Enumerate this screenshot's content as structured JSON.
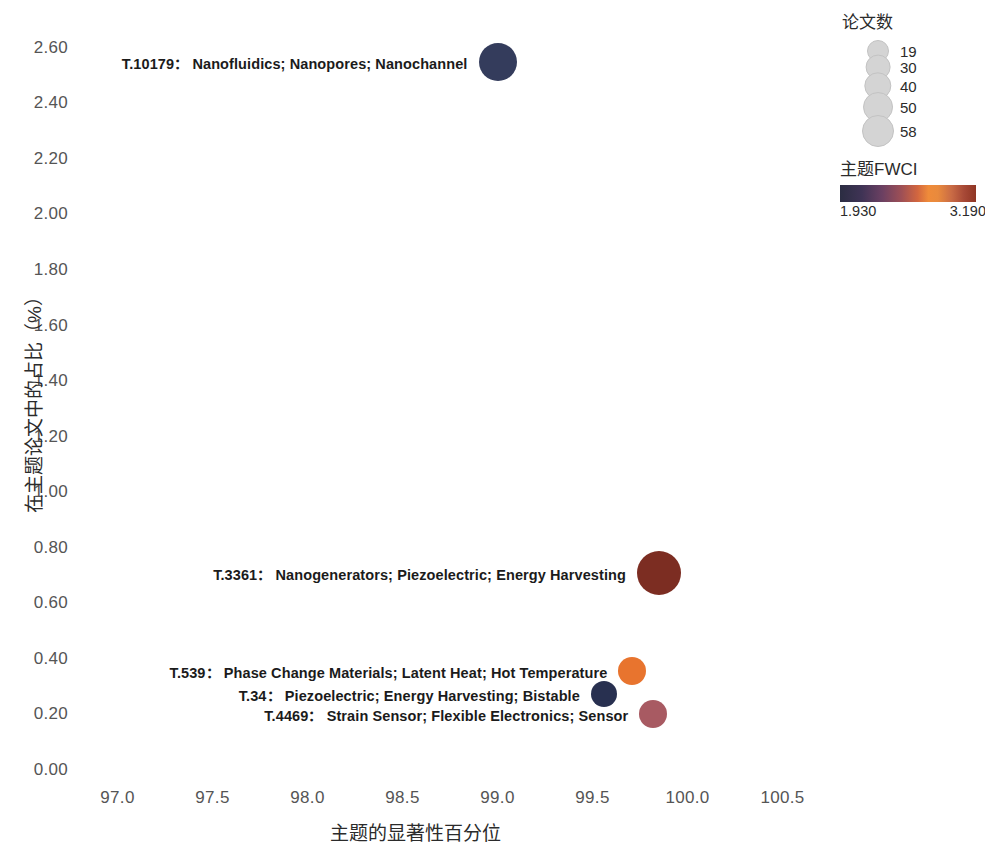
{
  "chart_data": {
    "type": "scatter",
    "title": "",
    "xlabel": "主题的显著性百分位",
    "ylabel": "在主题论文中的占比（%）",
    "xlim": [
      96.75,
      100.75
    ],
    "ylim": [
      0.0,
      2.7
    ],
    "xticks": [
      "97.0",
      "97.5",
      "98.0",
      "98.5",
      "99.0",
      "99.5",
      "100.0",
      "100.5"
    ],
    "xtick_values": [
      97.0,
      97.5,
      98.0,
      98.5,
      99.0,
      99.5,
      100.0,
      100.5
    ],
    "yticks": [
      "0.00",
      "0.20",
      "0.40",
      "0.60",
      "0.80",
      "1.00",
      "1.20",
      "1.40",
      "1.60",
      "1.80",
      "2.00",
      "2.20",
      "2.40",
      "2.60"
    ],
    "ytick_values": [
      0.0,
      0.2,
      0.4,
      0.6,
      0.8,
      1.0,
      1.2,
      1.4,
      1.6,
      1.8,
      2.0,
      2.2,
      2.4,
      2.6
    ],
    "grid": false,
    "legend_position": "right",
    "size_legend": {
      "title": "论文数",
      "values": [
        19,
        30,
        40,
        50,
        58
      ],
      "labels": [
        "19",
        "30",
        "40",
        "50",
        "58"
      ]
    },
    "color_legend": {
      "title": "主题FWCI",
      "min": "1.930",
      "max": "3.190",
      "min_value": 1.93,
      "max_value": 3.19,
      "colormap_stops": [
        "#2b2d42",
        "#6b4062",
        "#d2663f",
        "#ef8b3a",
        "#8f3524"
      ]
    },
    "points": [
      {
        "id": "T.10179",
        "keywords": "Nanofluidics; Nanopores; Nanochannel",
        "label": "T.10179：Nanofluidics; Nanopores; Nanochannel",
        "x": 99.0,
        "y": 2.55,
        "papers": 38,
        "fwci": 2.02,
        "color": "#343c5c",
        "radius_px": 19
      },
      {
        "id": "T.3361",
        "keywords": "Nanogenerators; Piezoelectric; Energy Harvesting",
        "label": "T.3361：Nanogenerators; Piezoelectric; Energy Harvesting",
        "x": 99.85,
        "y": 0.71,
        "papers": 58,
        "fwci": 3.19,
        "color": "#7c2d22",
        "radius_px": 22
      },
      {
        "id": "T.539",
        "keywords": "Phase Change Materials; Latent Heat; Hot Temperature",
        "label": "T.539：Phase Change Materials; Latent Heat; Hot Temperature",
        "x": 99.71,
        "y": 0.355,
        "papers": 30,
        "fwci": 2.88,
        "color": "#e8742e",
        "radius_px": 14
      },
      {
        "id": "T.34",
        "keywords": "Piezoelectric; Energy Harvesting; Bistable",
        "label": "T.34：Piezoelectric; Energy Harvesting; Bistable",
        "x": 99.56,
        "y": 0.275,
        "papers": 26,
        "fwci": 1.93,
        "color": "#283050",
        "radius_px": 13
      },
      {
        "id": "T.4469",
        "keywords": "Strain Sensor; Flexible Electronics; Sensor",
        "label": "T.4469：Strain Sensor; Flexible Electronics; Sensor",
        "x": 99.82,
        "y": 0.2,
        "papers": 28,
        "fwci": 2.62,
        "color": "#a85a62",
        "radius_px": 14
      }
    ]
  }
}
